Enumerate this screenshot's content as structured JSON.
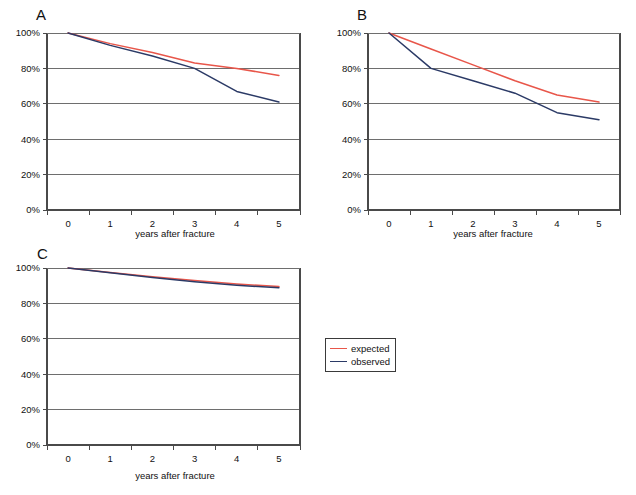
{
  "figure": {
    "panels": [
      {
        "letter": "A",
        "x": 36,
        "y": 6
      },
      {
        "letter": "B",
        "x": 357,
        "y": 6
      },
      {
        "letter": "C",
        "x": 37,
        "y": 245
      }
    ],
    "legend": {
      "x": 325,
      "y": 338,
      "entries": [
        {
          "label": "expected",
          "color": "#e8564a"
        },
        {
          "label": "observed",
          "color": "#2b3a66"
        }
      ]
    },
    "colors": {
      "expected": "#e8564a",
      "observed": "#2b3a66",
      "gridline": "#6e6e6e",
      "axis": "#4a4a4a",
      "text": "#111111"
    }
  },
  "chart_data": [
    {
      "type": "line",
      "panel": "A",
      "title": "",
      "xlabel": "years after fracture",
      "ylabel": "",
      "x": [
        0,
        1,
        2,
        3,
        4,
        5
      ],
      "xticklabels": [
        "0",
        "1",
        "2",
        "3",
        "4",
        "5"
      ],
      "yticklabels": [
        "0%",
        "20%",
        "40%",
        "60%",
        "80%",
        "100%"
      ],
      "ylim": [
        0,
        100
      ],
      "xlim": [
        -0.5,
        5.5
      ],
      "grid": true,
      "legend_position": "external-center",
      "series": [
        {
          "name": "expected",
          "color": "#e8564a",
          "values": [
            100,
            94,
            89,
            83,
            80,
            76
          ]
        },
        {
          "name": "observed",
          "color": "#2b3a66",
          "values": [
            100,
            93,
            87,
            80,
            67,
            61
          ]
        }
      ]
    },
    {
      "type": "line",
      "panel": "B",
      "title": "",
      "xlabel": "years after fracture",
      "ylabel": "",
      "x": [
        0,
        1,
        2,
        3,
        4,
        5
      ],
      "xticklabels": [
        "0",
        "1",
        "2",
        "3",
        "4",
        "5"
      ],
      "yticklabels": [
        "0%",
        "20%",
        "40%",
        "60%",
        "80%",
        "100%"
      ],
      "ylim": [
        0,
        100
      ],
      "xlim": [
        -0.5,
        5.5
      ],
      "grid": true,
      "legend_position": "external-center",
      "series": [
        {
          "name": "expected",
          "color": "#e8564a",
          "values": [
            100,
            91,
            82,
            73,
            65,
            61
          ]
        },
        {
          "name": "observed",
          "color": "#2b3a66",
          "values": [
            100,
            80,
            73,
            66,
            55,
            51
          ]
        }
      ]
    },
    {
      "type": "line",
      "panel": "C",
      "title": "",
      "xlabel": "years after fracture",
      "ylabel": "",
      "x": [
        0,
        1,
        2,
        3,
        4,
        5
      ],
      "xticklabels": [
        "0",
        "1",
        "2",
        "3",
        "4",
        "5"
      ],
      "yticklabels": [
        "0%",
        "20%",
        "40%",
        "60%",
        "80%",
        "100%"
      ],
      "ylim": [
        0,
        100
      ],
      "xlim": [
        -0.5,
        5.5
      ],
      "grid": true,
      "legend_position": "external-center",
      "series": [
        {
          "name": "expected",
          "color": "#e8564a",
          "values": [
            100,
            97.5,
            95,
            93,
            91,
            89.5
          ]
        },
        {
          "name": "observed",
          "color": "#2b3a66",
          "values": [
            100,
            97.3,
            94.6,
            92.3,
            90.3,
            88.8
          ]
        }
      ]
    }
  ]
}
